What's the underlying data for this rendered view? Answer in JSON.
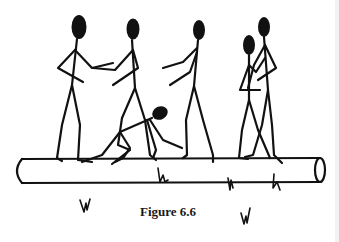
{
  "figure": {
    "caption": "Figure 6.6",
    "colors": {
      "ink": "#111111",
      "background": "#ffffff"
    },
    "elements": {
      "log": "horizontal log",
      "figures": [
        "handshake-left-figure",
        "handshake-right-figure",
        "crouching-figure",
        "reaching-figure",
        "pair-left-figure",
        "pair-right-figure"
      ],
      "grass_tufts": 5
    }
  }
}
